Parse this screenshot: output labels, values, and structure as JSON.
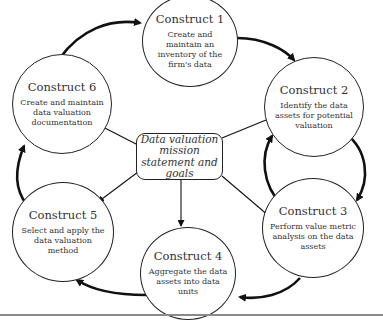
{
  "diagram": {
    "center": {
      "label": "Data valuation mission statement and goals"
    },
    "constructs": [
      {
        "title": "Construct 1",
        "description": "Create and maintain an inventory of the firm's data"
      },
      {
        "title": "Construct 2",
        "description": "Identify the data assets for potential valuation"
      },
      {
        "title": "Construct 3",
        "description": "Perform value metric analysis on the data assets"
      },
      {
        "title": "Construct 4",
        "description": "Aggregate the data assets into data units"
      },
      {
        "title": "Construct 5",
        "description": "Select and apply the data valuation method"
      },
      {
        "title": "Construct 6",
        "description": "Create and maintain data valuation documentation"
      }
    ],
    "flow": [
      {
        "from": "Construct 1",
        "to": "Construct 2"
      },
      {
        "from": "Construct 2",
        "to": "Construct 3"
      },
      {
        "from": "Construct 3",
        "to": "Construct 2"
      },
      {
        "from": "Construct 3",
        "to": "Construct 4"
      },
      {
        "from": "Construct 4",
        "to": "Construct 5"
      },
      {
        "from": "Construct 5",
        "to": "Construct 6"
      },
      {
        "from": "Construct 6",
        "to": "Construct 1"
      },
      {
        "from": "Center",
        "to": "Construct 3"
      },
      {
        "from": "Center",
        "to": "Construct 4"
      },
      {
        "from": "Center",
        "to": "Construct 6"
      },
      {
        "from": "Center",
        "to": "Construct 5"
      }
    ],
    "colors": {
      "stroke": "#222222",
      "text": "#333333",
      "rule": "#8a8a8a"
    }
  }
}
